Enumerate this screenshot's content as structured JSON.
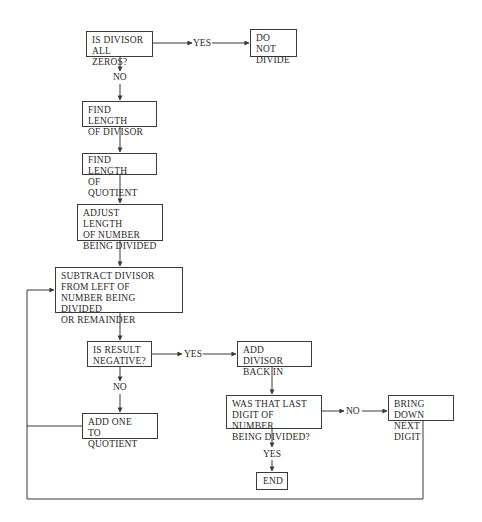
{
  "diagram": {
    "type": "flowchart",
    "topic": "Division algorithm",
    "nodes": {
      "is_divisor_zero": "IS DIVISOR\nALL ZEROS?",
      "do_not_divide": "DO NOT\nDIVIDE",
      "find_len_divisor": "FIND LENGTH\nOF DIVISOR",
      "find_len_quotient": "FIND LENGTH\nOF QUOTIENT",
      "adjust_length": "ADJUST LENGTH\nOF NUMBER\nBEING DIVIDED",
      "subtract_divisor": "SUBTRACT DIVISOR\nFROM LEFT OF\nNUMBER BEING DIVIDED\nOR REMAINDER",
      "is_result_negative": "IS RESULT\nNEGATIVE?",
      "add_divisor_back": "ADD DIVISOR\nBACK IN",
      "add_one_quotient": "ADD ONE\nTO QUOTIENT",
      "was_last_digit": "WAS THAT LAST\nDIGIT OF NUMBER\nBEING DIVIDED?",
      "bring_down_digit": "BRING DOWN\nNEXT DIGIT",
      "end": "END"
    },
    "edge_labels": {
      "zero_yes": "YES",
      "zero_no": "NO",
      "negative_yes": "YES",
      "negative_no": "NO",
      "last_digit_no": "NO",
      "last_digit_yes": "YES"
    },
    "edges": [
      {
        "from": "is_divisor_zero",
        "to": "do_not_divide",
        "label": "YES"
      },
      {
        "from": "is_divisor_zero",
        "to": "find_len_divisor",
        "label": "NO"
      },
      {
        "from": "find_len_divisor",
        "to": "find_len_quotient"
      },
      {
        "from": "find_len_quotient",
        "to": "adjust_length"
      },
      {
        "from": "adjust_length",
        "to": "subtract_divisor"
      },
      {
        "from": "subtract_divisor",
        "to": "is_result_negative"
      },
      {
        "from": "is_result_negative",
        "to": "add_divisor_back",
        "label": "YES"
      },
      {
        "from": "is_result_negative",
        "to": "add_one_quotient",
        "label": "NO"
      },
      {
        "from": "add_one_quotient",
        "to": "subtract_divisor",
        "label": "loop"
      },
      {
        "from": "add_divisor_back",
        "to": "was_last_digit"
      },
      {
        "from": "was_last_digit",
        "to": "bring_down_digit",
        "label": "NO"
      },
      {
        "from": "was_last_digit",
        "to": "end",
        "label": "YES"
      },
      {
        "from": "bring_down_digit",
        "to": "subtract_divisor",
        "label": "loop"
      }
    ]
  }
}
